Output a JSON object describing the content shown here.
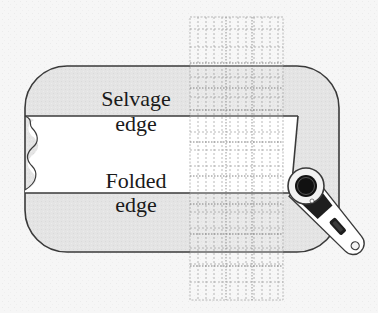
{
  "diagram": {
    "type": "fabric-cutting-illustration",
    "labels": {
      "selvage_line1": "Selvage",
      "selvage_line2": "edge",
      "folded_line1": "Folded",
      "folded_line2": "edge"
    },
    "elements": {
      "fabric_fold": "folded fabric (gray rounded rectangle)",
      "fabric_face": "white fabric band with wavy cut left edge",
      "ruler": "clear quilting ruler with dashed grid",
      "cutter": "rotary cutter"
    },
    "colors": {
      "background": "#f6f6f6",
      "fabric_gray": "#e4e4e4",
      "fabric_white": "#ffffff",
      "outline": "#3a3a3a",
      "ruler_grid": "#8a8a8a"
    }
  }
}
